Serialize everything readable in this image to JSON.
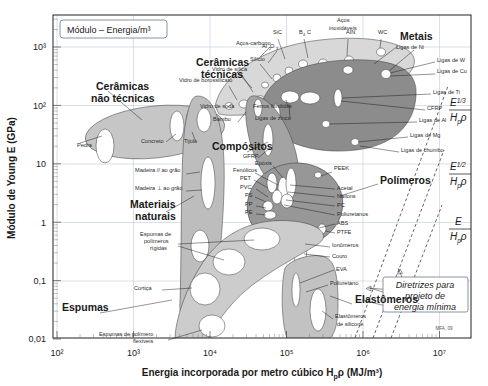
{
  "chart_data": {
    "type": "scatter",
    "title": "Módulo – Energia/m³",
    "xlabel": "Energia incorporada por metro cúbico H",
    "xlabel_sub": "p",
    "xlabel_tail": "ρ (MJ/m³)",
    "ylabel": "Módulo de Young E (GPa)",
    "xlim": [
      100,
      20000000
    ],
    "ylim": [
      0.005,
      2000
    ],
    "xticks": [
      "10²",
      "10³",
      "10⁴",
      "10⁵",
      "10⁶",
      "10⁷"
    ],
    "xtick_values": [
      100,
      1000,
      10000,
      100000,
      1000000,
      10000000
    ],
    "yticks": [
      "10³",
      "10²",
      "10",
      "1",
      "0,1",
      "0,01"
    ],
    "ytick_values": [
      1000,
      100,
      10,
      1,
      0.1,
      0.01
    ],
    "grid": true,
    "legend_position": "none",
    "credit": "MFA, 09",
    "families": [
      {
        "name": "Cerâmicas não técnicas",
        "color": "#c9c9c9"
      },
      {
        "name": "Cerâmicas técnicas",
        "color": "#d3d3d3"
      },
      {
        "name": "Metais",
        "color": "#8f8f8f"
      },
      {
        "name": "Compósitos",
        "color": "#a8a8a8"
      },
      {
        "name": "Polímeros",
        "color": "#9a9a9a"
      },
      {
        "name": "Materiais naturais",
        "color": "#bdbdbd"
      },
      {
        "name": "Espumas",
        "color": "#cccccc"
      },
      {
        "name": "Elastômeros",
        "color": "#c2c2c2"
      }
    ],
    "family_labels": [
      {
        "text": "Cerâmicas",
        "x": 96,
        "y": 90
      },
      {
        "text": "não técnicas",
        "x": 91,
        "y": 102
      },
      {
        "text": "Cerâmicas",
        "x": 196,
        "y": 66
      },
      {
        "text": "técnicas",
        "x": 201,
        "y": 78
      },
      {
        "text": "Metais",
        "x": 400,
        "y": 40
      },
      {
        "text": "Compósitos",
        "x": 212,
        "y": 150
      },
      {
        "text": "Polímeros",
        "x": 380,
        "y": 184
      },
      {
        "text": "Materiais",
        "x": 130,
        "y": 208
      },
      {
        "text": "naturais",
        "x": 135,
        "y": 220
      },
      {
        "text": "Espumas",
        "x": 62,
        "y": 311
      },
      {
        "text": "Elastômeros",
        "x": 355,
        "y": 303
      }
    ],
    "materials": [
      {
        "label": "Aços-carbono",
        "lx": 236,
        "ly": 45
      },
      {
        "label": "SiC",
        "lx": 273,
        "ly": 34
      },
      {
        "label": "B",
        "lx": 299,
        "ly": 34
      },
      {
        "label": "C",
        "lx": 307,
        "ly": 34
      },
      {
        "label": "Aços",
        "lx": 337,
        "ly": 22
      },
      {
        "label": "inoxidáveis",
        "lx": 329,
        "ly": 30
      },
      {
        "label": "AIN",
        "lx": 346,
        "ly": 34
      },
      {
        "label": "WC",
        "lx": 378,
        "ly": 34
      },
      {
        "label": "Al",
        "lx": 262,
        "ly": 48
      },
      {
        "label": "O",
        "lx": 270,
        "ly": 48
      },
      {
        "label": "Silício",
        "lx": 250,
        "ly": 61
      },
      {
        "label": "Vidro de sílica",
        "lx": 212,
        "ly": 71
      },
      {
        "label": "Vidro de borossilicato",
        "lx": 179,
        "ly": 82
      },
      {
        "label": "Vidro de soda",
        "lx": 200,
        "ly": 108
      },
      {
        "label": "Ferros fundidos",
        "lx": 253,
        "ly": 108
      },
      {
        "label": "Ligas de zinco",
        "lx": 255,
        "ly": 120
      },
      {
        "label": "Bambu",
        "lx": 213,
        "ly": 121
      },
      {
        "label": "Ligas de Ni",
        "lx": 396,
        "ly": 49
      },
      {
        "label": "Ligas de W",
        "lx": 437,
        "ly": 62
      },
      {
        "label": "Ligas de Cu",
        "lx": 437,
        "ly": 73
      },
      {
        "label": "Ligas de Ti",
        "lx": 433,
        "ly": 94
      },
      {
        "label": "CFRP",
        "lx": 427,
        "ly": 110
      },
      {
        "label": "Ligas de Al",
        "lx": 419,
        "ly": 122
      },
      {
        "label": "Ligas de Mg",
        "lx": 410,
        "ly": 137
      },
      {
        "label": "Ligas de chumbo",
        "lx": 401,
        "ly": 152
      },
      {
        "label": "GFRP",
        "lx": 243,
        "ly": 158
      },
      {
        "label": "Epóxis",
        "lx": 255,
        "ly": 165
      },
      {
        "label": "Fenólicos",
        "lx": 233,
        "ly": 172
      },
      {
        "label": "PET",
        "lx": 240,
        "ly": 180
      },
      {
        "label": "PVC",
        "lx": 240,
        "ly": 189
      },
      {
        "label": "PS",
        "lx": 245,
        "ly": 197
      },
      {
        "label": "PP",
        "lx": 245,
        "ly": 206
      },
      {
        "label": "PE",
        "lx": 245,
        "ly": 214
      },
      {
        "label": "PEEK",
        "lx": 334,
        "ly": 170
      },
      {
        "label": "Acetal",
        "lx": 337,
        "ly": 190
      },
      {
        "label": "Náilons",
        "lx": 337,
        "ly": 198
      },
      {
        "label": "PC",
        "lx": 337,
        "ly": 207
      },
      {
        "label": "Poliuretanos",
        "lx": 337,
        "ly": 216
      },
      {
        "label": "ABS",
        "lx": 337,
        "ly": 225
      },
      {
        "label": "PTFE",
        "lx": 337,
        "ly": 234
      },
      {
        "label": "Ionômeros",
        "lx": 332,
        "ly": 247
      },
      {
        "label": "Couro",
        "lx": 332,
        "ly": 258
      },
      {
        "label": "EVA",
        "lx": 336,
        "ly": 271
      },
      {
        "label": "Poliuretano",
        "lx": 330,
        "ly": 285
      },
      {
        "label": "Elastômeros",
        "lx": 335,
        "ly": 318
      },
      {
        "label": "de silicone",
        "lx": 337,
        "ly": 326
      },
      {
        "label": "Pedra",
        "lx": 77,
        "ly": 147
      },
      {
        "label": "Concreto",
        "lx": 141,
        "ly": 143
      },
      {
        "label": "Tijolo",
        "lx": 184,
        "ly": 143
      },
      {
        "label": "Madeira // ao grão",
        "lx": 135,
        "ly": 172
      },
      {
        "label": "Madeira ⊥ ao grão",
        "lx": 135,
        "ly": 190
      },
      {
        "label": "Espumas de",
        "lx": 140,
        "ly": 236
      },
      {
        "label": "polímeros",
        "lx": 144,
        "ly": 243
      },
      {
        "label": "rígidas",
        "lx": 150,
        "ly": 250
      },
      {
        "label": "Cortiça",
        "lx": 134,
        "ly": 290
      },
      {
        "label": "Espumas de polímero",
        "lx": 99,
        "ly": 336
      },
      {
        "label": "flexíveis",
        "lx": 133,
        "ly": 343
      }
    ],
    "guidelines": [
      {
        "label_num": "E",
        "label_exp": "1/3",
        "label_den": "Hpρ",
        "x": 456,
        "y": 108
      },
      {
        "label_num": "E",
        "label_exp": "1/2",
        "label_den": "Hpρ",
        "x": 456,
        "y": 172
      },
      {
        "label_num": "E",
        "label_exp": "",
        "label_den": "Hpρ",
        "x": 456,
        "y": 227
      }
    ],
    "guideline_note": [
      "Diretrizes para",
      "projeto de",
      "energia mínima"
    ]
  }
}
